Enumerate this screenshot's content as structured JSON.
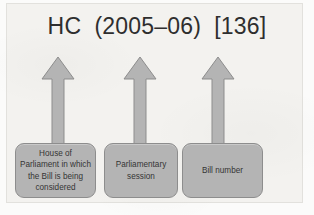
{
  "figure": {
    "citation": "HC  (2005–06)  [136]",
    "colors": {
      "background": "#f3f2ef",
      "shape_fill": "#b4b4b4",
      "shape_border": "#8d8d8d",
      "text": "#2e2e2e"
    }
  },
  "annotations": [
    {
      "id": "house-of-parliament",
      "arrow_name": "arrow-up-house-of-parliament",
      "box_name": "caption-box-house-of-parliament",
      "label": "House of Parliament in which the Bill is being considered",
      "points_to": "HC"
    },
    {
      "id": "parliamentary-session",
      "arrow_name": "arrow-up-parliamentary-session",
      "box_name": "caption-box-parliamentary-session",
      "label": "Parliamentary session",
      "points_to": "(2005–06)"
    },
    {
      "id": "bill-number",
      "arrow_name": "arrow-up-bill-number",
      "box_name": "caption-box-bill-number",
      "label": "Bill number",
      "points_to": "[136]"
    }
  ]
}
